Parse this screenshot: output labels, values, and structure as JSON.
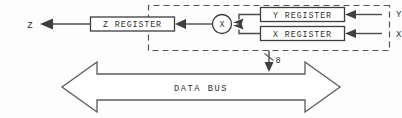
{
  "diagram": {
    "orientation": "horizontally-mirrored",
    "registers": [
      {
        "id": "y",
        "label": "Y REGISTER"
      },
      {
        "id": "x",
        "label": "X REGISTER"
      },
      {
        "id": "z",
        "label": "Z REGISTER"
      }
    ],
    "operator": {
      "symbol": "X",
      "name": "multiplier"
    },
    "ports": [
      {
        "id": "input-y",
        "label": "Y"
      },
      {
        "id": "input-x",
        "label": "X"
      },
      {
        "id": "output-z",
        "label": "Z"
      }
    ],
    "bus": {
      "label": "DATA BUS",
      "width_label": "8"
    },
    "colors": {
      "line": "#4c4c4c",
      "box_stroke": "#3d3d3d",
      "dash_stroke": "#555555",
      "text": "#2e2e2e",
      "background": "#fdfdfd"
    }
  }
}
